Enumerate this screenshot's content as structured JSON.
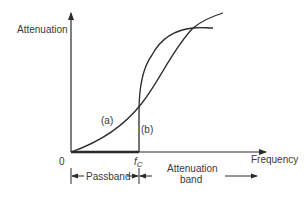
{
  "diagram": {
    "y_axis_label": "Attenuation",
    "x_axis_label": "Frequency",
    "origin_label": "0",
    "cutoff_label": "f",
    "cutoff_subscript": "C",
    "curve_a_label": "(a)",
    "curve_b_label": "(b)",
    "passband_label": "Passband",
    "attenuation_band_label_line1": "Attenuation",
    "attenuation_band_label_line2": "band",
    "colors": {
      "stroke": "#2b2b2b",
      "text": "#3a3a3a",
      "background": "#ffffff"
    }
  }
}
